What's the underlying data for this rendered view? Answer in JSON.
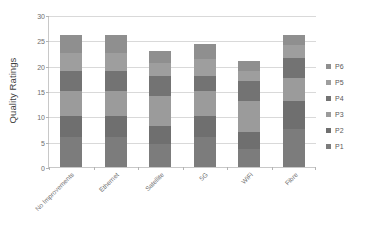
{
  "chart_data": {
    "type": "bar",
    "stacked": true,
    "title": "",
    "xlabel": "",
    "ylabel": "Quality Ratings",
    "ylim": [
      0,
      30
    ],
    "yticks": [
      0,
      5,
      10,
      15,
      20,
      25,
      30
    ],
    "grid": true,
    "legend_position": "right",
    "categories": [
      "No Improvements",
      "Ethernet",
      "Satellite",
      "5G",
      "WiFi",
      "Fibre"
    ],
    "series": [
      {
        "name": "P1",
        "color": "#7c7c7c",
        "values": [
          6.0,
          6.0,
          4.5,
          6.0,
          3.5,
          7.5
        ]
      },
      {
        "name": "P2",
        "color": "#6f6f6f",
        "values": [
          4.0,
          4.0,
          3.5,
          4.0,
          3.5,
          5.5
        ]
      },
      {
        "name": "P3",
        "color": "#9b9b9b",
        "values": [
          5.0,
          5.0,
          6.0,
          5.0,
          6.0,
          4.5
        ]
      },
      {
        "name": "P4",
        "color": "#737373",
        "values": [
          4.0,
          4.0,
          4.0,
          3.0,
          4.0,
          4.0
        ]
      },
      {
        "name": "P5",
        "color": "#9e9e9e",
        "values": [
          3.5,
          3.5,
          2.5,
          3.3,
          2.0,
          2.5
        ]
      },
      {
        "name": "P6",
        "color": "#8f8f8f",
        "values": [
          3.5,
          3.5,
          2.5,
          3.0,
          2.0,
          2.0
        ]
      }
    ],
    "totals": [
      26.0,
      26.0,
      23.0,
      24.3,
      21.0,
      26.0
    ]
  },
  "legend": {
    "items": [
      {
        "label": "P6",
        "color": "#8f8f8f"
      },
      {
        "label": "P5",
        "color": "#9e9e9e"
      },
      {
        "label": "P4",
        "color": "#737373"
      },
      {
        "label": "P3",
        "color": "#9b9b9b"
      },
      {
        "label": "P2",
        "color": "#6f6f6f"
      },
      {
        "label": "P1",
        "color": "#7c7c7c"
      }
    ]
  },
  "axes": {
    "y_title": "Quality Ratings"
  }
}
